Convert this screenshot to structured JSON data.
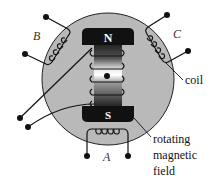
{
  "diagram": {
    "poles": {
      "north": "N",
      "south": "S"
    },
    "coil_labels": {
      "a": "A",
      "b": "B",
      "c": "C"
    },
    "annotations": {
      "coil": "coil",
      "field_line1": "rotating",
      "field_line2": "magnetic",
      "field_line3": "field"
    },
    "colors": {
      "stator": "#b9b9b9",
      "pole": "#111111",
      "wire": "#111111",
      "background": "#ffffff"
    }
  }
}
